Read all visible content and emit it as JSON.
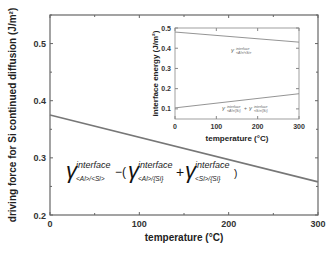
{
  "chart_data": [
    {
      "type": "line",
      "title": "",
      "xlabel": "temperature (°C)",
      "ylabel": "driving force for Si continued diffusion (J/m²)",
      "xlim": [
        0,
        300
      ],
      "ylim": [
        0.2,
        0.55
      ],
      "xticks": [
        "0",
        "100",
        "200",
        "300"
      ],
      "yticks": [
        "0.2",
        "0.3",
        "0.4",
        "0.5"
      ],
      "grid": false,
      "series": [
        {
          "name": "γ<Al>/<Si> − (γ<Al>/{Si} + γ<Si>/{Si})",
          "x": [
            0,
            300
          ],
          "y": [
            0.375,
            0.258
          ]
        }
      ],
      "annotation": {
        "gamma": "γ",
        "sup": "interface",
        "terms": [
          "<Al>/<Si>",
          "<Al>/{Si}",
          "<Si>/{Si}"
        ],
        "ops": [
          "−(",
          "+",
          ")"
        ]
      }
    },
    {
      "type": "line",
      "title": "inset",
      "xlabel": "temperature (°C)",
      "ylabel": "interface energy (J/m²)",
      "xlim": [
        0,
        300
      ],
      "ylim": [
        0.05,
        0.5
      ],
      "xticks": [
        "0",
        "100",
        "200",
        "300"
      ],
      "yticks": [
        "0.1",
        "0.2",
        "0.3",
        "0.4",
        "0.5"
      ],
      "series": [
        {
          "name": "γ interface <Al>/<Si>",
          "x": [
            0,
            300
          ],
          "y": [
            0.48,
            0.43
          ]
        },
        {
          "name": "γ interface <Al>/{Si} + γ interface <Si>/{Si}",
          "x": [
            0,
            300
          ],
          "y": [
            0.105,
            0.175
          ]
        }
      ]
    }
  ]
}
